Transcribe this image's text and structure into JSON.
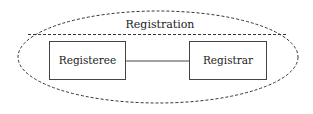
{
  "diagram": {
    "group": {
      "label": "Registration",
      "shape": "dashed-ellipse"
    },
    "nodes": [
      {
        "id": "registeree",
        "label": "Registeree"
      },
      {
        "id": "registrar",
        "label": "Registrar"
      }
    ],
    "edges": [
      {
        "from": "registeree",
        "to": "registrar",
        "style": "solid"
      }
    ],
    "colors": {
      "stroke": "#333333",
      "text": "#222222",
      "background": "#ffffff"
    }
  }
}
